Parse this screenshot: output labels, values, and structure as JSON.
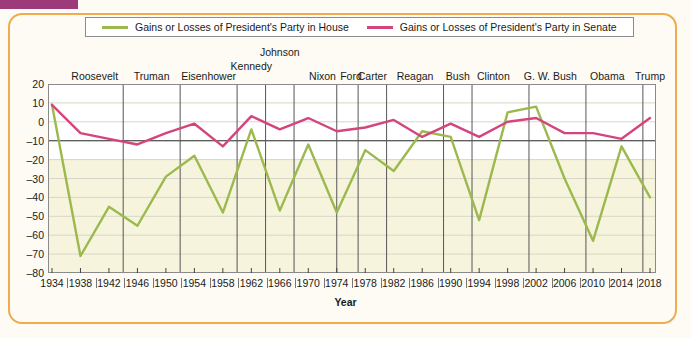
{
  "corner_marker": {
    "color": "#9c3a7a"
  },
  "card": {
    "border_color": "#f0ab4e"
  },
  "legend": {
    "entries": [
      {
        "label": "Gains or Losses of President's Party in House",
        "color": "#9cb94e",
        "icon": "line-swatch-icon"
      },
      {
        "label": "Gains or Losses of President's Party in Senate",
        "color": "#d4457f",
        "icon": "line-swatch-icon"
      }
    ]
  },
  "chart_data": {
    "type": "line",
    "title": "",
    "xlabel": "Year",
    "ylabel": "",
    "xlim": [
      1934,
      2018
    ],
    "ylim": [
      -80,
      20
    ],
    "ytick_step": 10,
    "grid": true,
    "legend_position": "top",
    "x": [
      1934,
      1938,
      1942,
      1946,
      1950,
      1954,
      1958,
      1962,
      1966,
      1970,
      1974,
      1978,
      1982,
      1986,
      1990,
      1994,
      1998,
      2002,
      2006,
      2010,
      2014,
      2018
    ],
    "xtick_labels": [
      "1934",
      "1938",
      "1942",
      "1946",
      "1950",
      "1954",
      "1958",
      "1962",
      "1966",
      "1970",
      "1974",
      "1978",
      "1982",
      "1986",
      "1990",
      "1994",
      "1998",
      "2002",
      "2006",
      "2010",
      "2014",
      "2018"
    ],
    "ytick_labels": [
      "20",
      "10",
      "0",
      "-10",
      "-20",
      "-30",
      "-40",
      "-50",
      "-60",
      "-70",
      "-80"
    ],
    "series": [
      {
        "name": "Gains or Losses of President's Party in House",
        "color": "#9cb94e",
        "values": [
          9,
          -71,
          -45,
          -55,
          -29,
          -18,
          -48,
          -4,
          -47,
          -12,
          -48,
          -15,
          -26,
          -5,
          -8,
          -52,
          5,
          8,
          -30,
          -63,
          -13,
          -40
        ]
      },
      {
        "name": "Gains or Losses of President's Party in Senate",
        "color": "#d4457f",
        "values": [
          9,
          -6,
          -9,
          -12,
          -6,
          -1,
          -13,
          3,
          -4,
          2,
          -5,
          -3,
          1,
          -8,
          -1,
          -8,
          0,
          2,
          -6,
          -6,
          -9,
          2
        ]
      }
    ],
    "president_labels": [
      {
        "name": "Roosevelt",
        "x": 1940
      },
      {
        "name": "Truman",
        "x": 1948
      },
      {
        "name": "Eisenhower",
        "x": 1956
      },
      {
        "name": "Kennedy",
        "x": 1962
      },
      {
        "name": "Johnson",
        "x": 1966
      },
      {
        "name": "Nixon",
        "x": 1972
      },
      {
        "name": "Ford",
        "x": 1976
      },
      {
        "name": "Carter",
        "x": 1979
      },
      {
        "name": "Reagan",
        "x": 1985
      },
      {
        "name": "Bush",
        "x": 1991
      },
      {
        "name": "Clinton",
        "x": 1996
      },
      {
        "name": "G. W. Bush",
        "x": 2004
      },
      {
        "name": "Obama",
        "x": 2012
      },
      {
        "name": "Trump",
        "x": 2018
      }
    ],
    "president_dividers": [
      1944,
      1952,
      1960,
      1964,
      1968,
      1974,
      1977,
      1981,
      1989,
      1993,
      2001,
      2009,
      2017
    ]
  }
}
